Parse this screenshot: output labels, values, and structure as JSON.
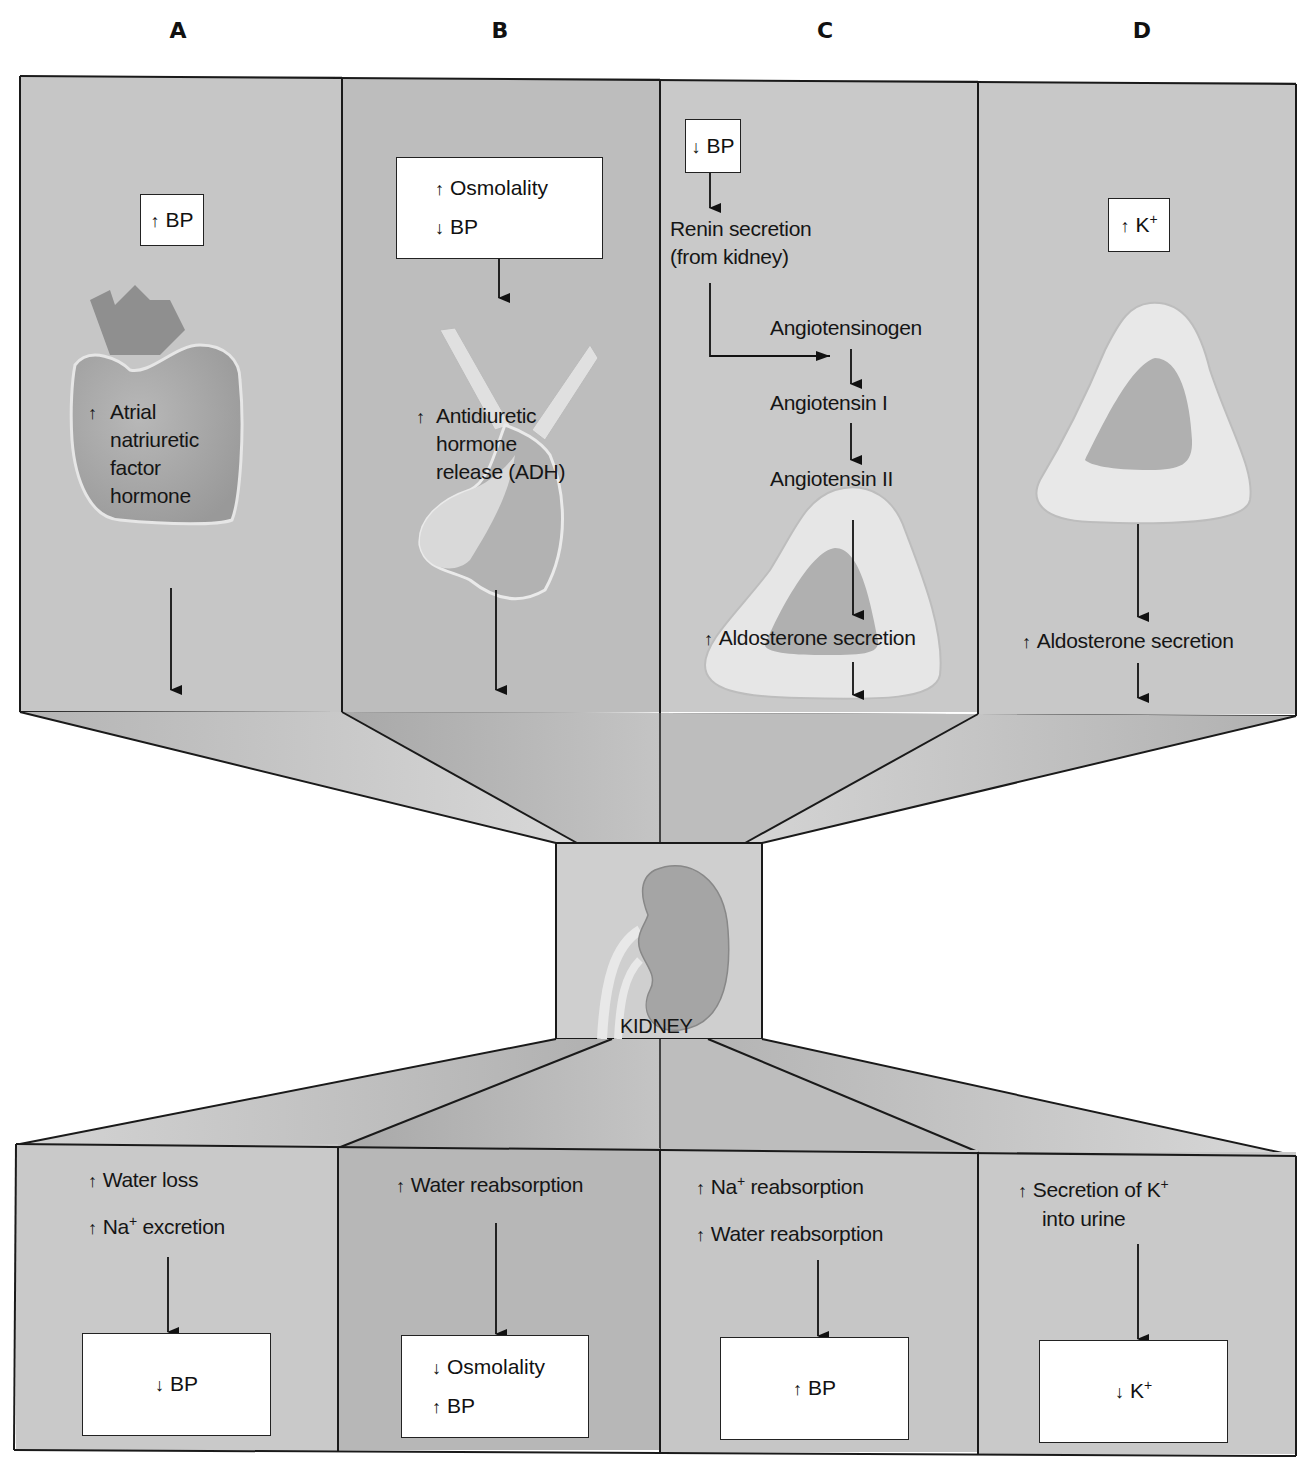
{
  "columns": [
    {
      "letter": "A"
    },
    {
      "letter": "B"
    },
    {
      "letter": "C"
    },
    {
      "letter": "D"
    }
  ],
  "top_panels": {
    "A": {
      "trigger_box": {
        "arrow": "↑",
        "text": "BP"
      },
      "organ": "heart",
      "hormone_arrow": "↑",
      "hormone_lines": [
        "Atrial",
        "natriuretic",
        "factor",
        "hormone"
      ]
    },
    "B": {
      "trigger_box": {
        "lines": [
          {
            "arrow": "↑",
            "text": "Osmolality"
          },
          {
            "arrow": "↓",
            "text": "BP"
          }
        ]
      },
      "organ": "pituitary",
      "hormone_arrow": "↑",
      "hormone_lines": [
        "Antidiuretic",
        "hormone",
        "release (ADH)"
      ]
    },
    "C": {
      "trigger_box": {
        "arrow": "↓",
        "text": "BP"
      },
      "renin_lines": [
        "Renin secretion",
        "(from kidney)"
      ],
      "cascade": [
        "Angiotensinogen",
        "Angiotensin I",
        "Angiotensin II"
      ],
      "organ": "adrenal gland",
      "result_arrow": "↑",
      "result": "Aldosterone secretion"
    },
    "D": {
      "trigger_box": {
        "arrow": "↑",
        "text": "K",
        "sup": "+"
      },
      "organ": "adrenal gland",
      "result_arrow": "↑",
      "result": "Aldosterone secretion"
    }
  },
  "center": {
    "label": "KIDNEY",
    "organ": "kidney"
  },
  "bottom_panels": {
    "A": {
      "effects": [
        {
          "arrow": "↑",
          "text": "Water loss"
        },
        {
          "arrow": "↑",
          "text": "Na",
          "sup": "+",
          "rest": " excretion"
        }
      ],
      "outcome": [
        {
          "arrow": "↓",
          "text": "BP"
        }
      ]
    },
    "B": {
      "effects": [
        {
          "arrow": "↑",
          "text": "Water reabsorption"
        }
      ],
      "outcome": [
        {
          "arrow": "↓",
          "text": "Osmolality"
        },
        {
          "arrow": "↑",
          "text": "BP"
        }
      ]
    },
    "C": {
      "effects": [
        {
          "arrow": "↑",
          "text": "Na",
          "sup": "+",
          "rest": " reabsorption"
        },
        {
          "arrow": "↑",
          "text": "Water reabsorption"
        }
      ],
      "outcome": [
        {
          "arrow": "↑",
          "text": "BP"
        }
      ]
    },
    "D": {
      "effects": [
        {
          "arrow": "↑",
          "text": "Secretion of K",
          "sup": "+"
        },
        {
          "arrow": "",
          "text": "into urine"
        }
      ],
      "outcome": [
        {
          "arrow": "↓",
          "text": "K",
          "sup": "+"
        }
      ]
    }
  },
  "colors": {
    "panel_gray": "#c9c9c9",
    "panel_gray_dark": "#b9b9b9",
    "organ_fill": "#a9a9a9",
    "organ_light": "#e3e3e3",
    "line": "#1a1a1a"
  }
}
